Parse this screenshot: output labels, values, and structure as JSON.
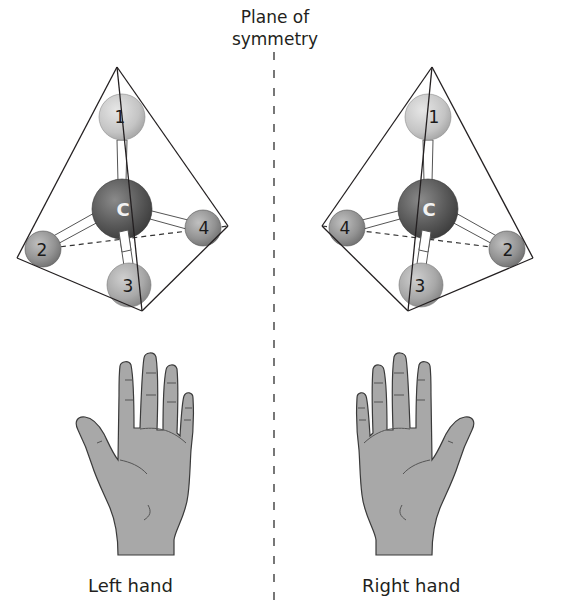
{
  "title": {
    "line1": "Plane of",
    "line2": "symmetry"
  },
  "labels": {
    "left": "Left hand",
    "right": "Right hand"
  },
  "molecules": {
    "left": {
      "center_label": "C",
      "substituents": [
        "1",
        "2",
        "3",
        "4"
      ]
    },
    "right": {
      "center_label": "C",
      "substituents": [
        "1",
        "2",
        "3",
        "4"
      ]
    }
  },
  "colors": {
    "carbon": "#5a5a5a",
    "atom_light": "#c8c8c8",
    "atom_mid": "#8f8f8f",
    "hand_fill": "#a9a9a9",
    "line": "#231f20"
  }
}
